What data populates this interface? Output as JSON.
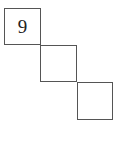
{
  "diagram": {
    "cells": [
      {
        "label": "9"
      },
      {
        "label": ""
      },
      {
        "label": ""
      }
    ],
    "border_color": "#555555"
  }
}
